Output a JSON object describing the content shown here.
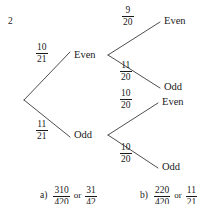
{
  "question": {
    "number": "2"
  },
  "diagram": {
    "type": "probability-tree",
    "root": {
      "x": 24,
      "y": 100
    },
    "level1": [
      {
        "label": "Even",
        "probability": {
          "numerator": "10",
          "denominator": "21"
        },
        "node": {
          "x": 110,
          "y": 55
        },
        "label_pos": {
          "x": 74,
          "y": 50
        },
        "frac_pos": {
          "x": 36,
          "y": 43
        }
      },
      {
        "label": "Odd",
        "probability": {
          "numerator": "11",
          "denominator": "21"
        },
        "node": {
          "x": 110,
          "y": 135
        },
        "label_pos": {
          "x": 74,
          "y": 130
        },
        "frac_pos": {
          "x": 36,
          "y": 120
        }
      }
    ],
    "level2": [
      {
        "parent": "Even",
        "label": "Even",
        "probability": {
          "numerator": "9",
          "denominator": "20"
        },
        "end": {
          "x": 160,
          "y": 22
        },
        "label_pos": {
          "x": 164,
          "y": 16
        },
        "frac_pos": {
          "x": 120,
          "y": 5
        }
      },
      {
        "parent": "Even",
        "label": "Odd",
        "probability": {
          "numerator": "11",
          "denominator": "20"
        },
        "end": {
          "x": 160,
          "y": 88
        },
        "label_pos": {
          "x": 164,
          "y": 82
        },
        "frac_pos": {
          "x": 118,
          "y": 60
        }
      },
      {
        "parent": "Odd",
        "label": "Even",
        "probability": {
          "numerator": "10",
          "denominator": "20"
        },
        "end": {
          "x": 158,
          "y": 103
        },
        "label_pos": {
          "x": 162,
          "y": 97
        },
        "frac_pos": {
          "x": 118,
          "y": 88
        }
      },
      {
        "parent": "Odd",
        "label": "Odd",
        "probability": {
          "numerator": "10",
          "denominator": "20"
        },
        "end": {
          "x": 158,
          "y": 168
        },
        "label_pos": {
          "x": 162,
          "y": 162
        },
        "frac_pos": {
          "x": 118,
          "y": 142
        }
      }
    ],
    "line_color": "#3a3a3a"
  },
  "answers": [
    {
      "tag": "a)",
      "fraction1": {
        "numerator": "310",
        "denominator": "420"
      },
      "connector": "or",
      "fraction2": {
        "numerator": "31",
        "denominator": "42"
      },
      "pos": {
        "x": 40,
        "y": 186
      }
    },
    {
      "tag": "b)",
      "fraction1": {
        "numerator": "220",
        "denominator": "420"
      },
      "connector": "or",
      "fraction2": {
        "numerator": "11",
        "denominator": "21"
      },
      "pos": {
        "x": 140,
        "y": 186
      }
    }
  ]
}
